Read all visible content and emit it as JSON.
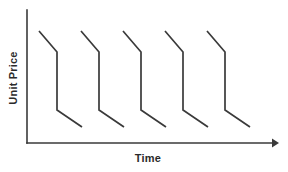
{
  "chart_data": {
    "type": "line",
    "title": "",
    "subtitle": "",
    "xlabel": "Time",
    "ylabel": "Unit Price",
    "grid": false,
    "legend": false,
    "legend_position": "none",
    "axis_style": "open-corner with arrow on x-axis, no tick marks, no tick labels",
    "xlim": [
      0,
      1
    ],
    "ylim": [
      0,
      1
    ],
    "xticks": [],
    "yticks": [],
    "xticklabels": [],
    "yticklabels": [],
    "series": [
      {
        "name": "Unit Price",
        "color": "#3a3a3a",
        "cycles": 5,
        "cycle_period_px": 42,
        "points_px": [
          [
            39,
            31
          ],
          [
            57,
            52
          ],
          [
            57,
            110
          ],
          [
            82,
            127
          ],
          [
            81,
            31
          ],
          [
            99,
            52
          ],
          [
            99,
            110
          ],
          [
            124,
            127
          ],
          [
            123,
            31
          ],
          [
            141,
            52
          ],
          [
            141,
            110
          ],
          [
            166,
            127
          ],
          [
            165,
            31
          ],
          [
            183,
            52
          ],
          [
            183,
            110
          ],
          [
            208,
            127
          ],
          [
            207,
            31
          ],
          [
            225,
            52
          ],
          [
            225,
            110
          ],
          [
            250,
            127
          ]
        ],
        "cycle_shape": [
          {
            "segment": "gradual-decline",
            "dx": 18,
            "dy": 21
          },
          {
            "segment": "steep-drop",
            "dx": 0,
            "dy": 58
          },
          {
            "segment": "gradual-decline",
            "dx": 25,
            "dy": 17
          }
        ]
      }
    ],
    "axes_px": {
      "y_axis": {
        "x": 27,
        "y_top": 10,
        "y_bottom": 143
      },
      "x_axis": {
        "y": 143,
        "x_left": 27,
        "x_right": 272
      },
      "arrow_tip_px": [
        279,
        143
      ]
    },
    "colors": {
      "line": "#3a3a3a",
      "axis": "#3a3a3a",
      "text": "#2b2b2b",
      "background": "#ffffff"
    }
  }
}
